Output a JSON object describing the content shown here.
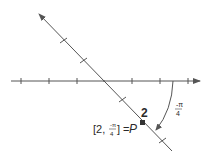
{
  "diagram": {
    "type": "polar coordinate plot",
    "point": {
      "name": "P",
      "r": 2,
      "theta": "-π/4",
      "label_prefix": "[2, ",
      "label_theta_num": "-π",
      "label_theta_den": "4",
      "label_suffix": "] = ",
      "label_name": "P"
    },
    "radius_label": "2",
    "angle_label": {
      "num": "-π",
      "den": "4"
    },
    "colors": {
      "line": "#555555",
      "text": "#2a2a2a",
      "point": "#333333"
    }
  }
}
